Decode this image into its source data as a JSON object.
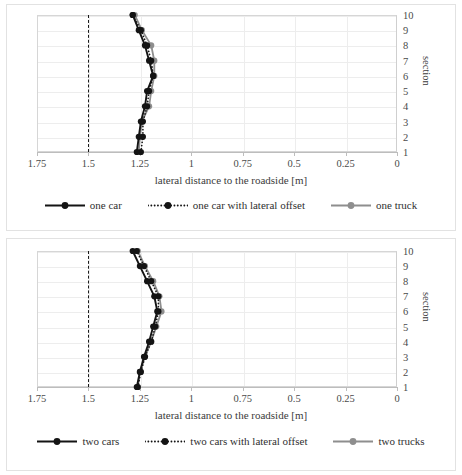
{
  "figure": {
    "panels": [
      {
        "id": "top",
        "axis": {
          "xlabel": "lateral distance to the roadside [m]",
          "ylabel": "section",
          "xticks": [
            "1.75",
            "1.5",
            "1.25",
            "1",
            "0.75",
            "0.5",
            "0.25",
            "0"
          ],
          "xtickvals": [
            1.75,
            1.5,
            1.25,
            1,
            0.75,
            0.5,
            0.25,
            0
          ],
          "yticks": [
            "1",
            "2",
            "3",
            "4",
            "5",
            "6",
            "7",
            "8",
            "9",
            "10"
          ],
          "xlim": [
            1.75,
            0
          ],
          "ylim": [
            1,
            10
          ],
          "reversed_x": true,
          "grid": "horizontal+vertical light"
        },
        "threshold": {
          "value": 1.5,
          "style": "dashed",
          "color": "#1a1a1a"
        },
        "legend": [
          {
            "label": "one car",
            "color": "#141414",
            "style": "solid"
          },
          {
            "label": "one car with lateral offset",
            "color": "#141414",
            "style": "dotted"
          },
          {
            "label": "one truck",
            "color": "#8e8e8e",
            "style": "solid"
          }
        ]
      },
      {
        "id": "bottom",
        "axis": {
          "xlabel": "lateral distance to the roadside [m]",
          "ylabel": "section",
          "xticks": [
            "1.75",
            "1.5",
            "1.25",
            "1",
            "0.75",
            "0.5",
            "0.25",
            "0"
          ],
          "xtickvals": [
            1.75,
            1.5,
            1.25,
            1,
            0.75,
            0.5,
            0.25,
            0
          ],
          "yticks": [
            "1",
            "2",
            "3",
            "4",
            "5",
            "6",
            "7",
            "8",
            "9",
            "10"
          ],
          "xlim": [
            1.75,
            0
          ],
          "ylim": [
            1,
            10
          ],
          "reversed_x": true,
          "grid": "horizontal+vertical light"
        },
        "threshold": {
          "value": 1.5,
          "style": "dashed",
          "color": "#1a1a1a"
        },
        "legend": [
          {
            "label": "two cars",
            "color": "#141414",
            "style": "solid"
          },
          {
            "label": "two cars with lateral offset",
            "color": "#141414",
            "style": "dotted"
          },
          {
            "label": "two trucks",
            "color": "#8e8e8e",
            "style": "solid"
          }
        ]
      }
    ]
  },
  "chart_data": [
    {
      "type": "line",
      "panel": "top",
      "title": "",
      "xlabel": "lateral distance to the roadside [m]",
      "ylabel": "section",
      "xlim": [
        1.75,
        0
      ],
      "ylim": [
        1,
        10
      ],
      "x_axis_reversed": true,
      "grid": true,
      "legend_position": "bottom",
      "categories": [
        1,
        2,
        3,
        4,
        5,
        6,
        7,
        8,
        9,
        10
      ],
      "annotations": [
        {
          "type": "vline",
          "value": 1.5,
          "label": "",
          "style": "dashed"
        }
      ],
      "series": [
        {
          "name": "one car",
          "color": "#141414",
          "style": "solid",
          "values": [
            1.265,
            1.255,
            1.245,
            1.225,
            1.215,
            1.185,
            1.205,
            1.225,
            1.255,
            1.285
          ]
        },
        {
          "name": "one car with lateral offset",
          "color": "#141414",
          "style": "dotted",
          "values": [
            1.245,
            1.235,
            1.235,
            1.215,
            1.205,
            1.185,
            1.195,
            1.215,
            1.245,
            1.285
          ]
        },
        {
          "name": "one truck",
          "color": "#8e8e8e",
          "style": "solid",
          "values": [
            1.255,
            1.25,
            1.24,
            1.205,
            1.195,
            1.18,
            1.18,
            1.195,
            1.24,
            1.275
          ]
        }
      ]
    },
    {
      "type": "line",
      "panel": "bottom",
      "title": "",
      "xlabel": "lateral distance to the roadside [m]",
      "ylabel": "section",
      "xlim": [
        1.75,
        0
      ],
      "ylim": [
        1,
        10
      ],
      "x_axis_reversed": true,
      "grid": true,
      "legend_position": "bottom",
      "categories": [
        1,
        2,
        3,
        4,
        5,
        6,
        7,
        8,
        9,
        10
      ],
      "annotations": [
        {
          "type": "vline",
          "value": 1.5,
          "label": "",
          "style": "dashed"
        }
      ],
      "series": [
        {
          "name": "two cars",
          "color": "#141414",
          "style": "solid",
          "values": [
            1.265,
            1.25,
            1.23,
            1.205,
            1.185,
            1.165,
            1.18,
            1.215,
            1.25,
            1.285
          ]
        },
        {
          "name": "two cars with lateral offset",
          "color": "#141414",
          "style": "dotted",
          "values": [
            1.26,
            1.245,
            1.225,
            1.195,
            1.175,
            1.16,
            1.16,
            1.195,
            1.23,
            1.265
          ]
        },
        {
          "name": "two trucks",
          "color": "#8e8e8e",
          "style": "solid",
          "values": [
            1.26,
            1.25,
            1.225,
            1.195,
            1.17,
            1.145,
            1.155,
            1.185,
            1.225,
            1.26
          ]
        }
      ]
    }
  ]
}
